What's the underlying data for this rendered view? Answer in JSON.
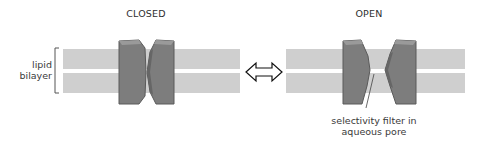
{
  "panels": {
    "closed": {
      "title": "CLOSED"
    },
    "open": {
      "title": "OPEN"
    }
  },
  "labels": {
    "bilayer_line1": "lipid",
    "bilayer_line2": "bilayer",
    "filter_line1": "selectivity filter in",
    "filter_line2": "aqueous pore"
  },
  "icons": {
    "transition": "double-headed-arrow"
  },
  "colors": {
    "lipid": "#cfcfcf",
    "channel_fill": "#7d7d7d",
    "channel_edge": "#555555",
    "channel_highlight": "#9a9a9a",
    "text": "#333333"
  }
}
